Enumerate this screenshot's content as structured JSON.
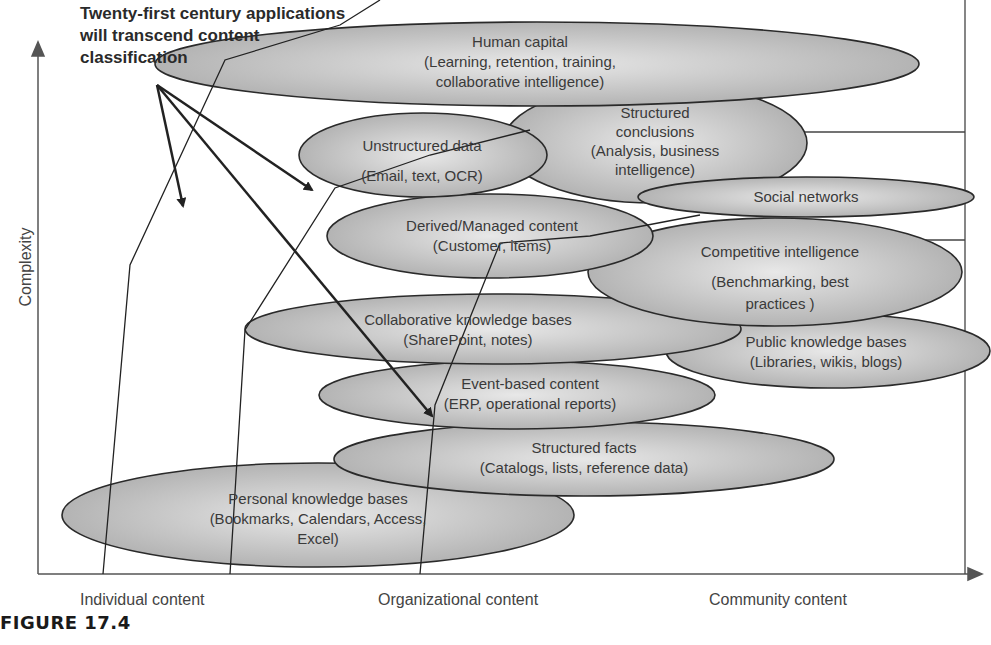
{
  "note": {
    "line1": "Twenty-first century  applications",
    "line2": "will transcend content",
    "line3": "classification"
  },
  "axes": {
    "y_label": "Complexity",
    "x_labels": [
      "Individual content",
      "Organizational  content",
      "Community content"
    ]
  },
  "caption": "FIGURE 17.4",
  "ellipses": [
    {
      "id": "human-capital",
      "lines": [
        "Human capital",
        "(Learning, retention, training,",
        "collaborative intelligence)"
      ]
    },
    {
      "id": "structured-conclusions",
      "lines": [
        "Structured",
        "conclusions",
        "(Analysis, business",
        "intelligence)"
      ]
    },
    {
      "id": "unstructured-data",
      "lines": [
        "Unstructured data",
        "(Email, text, OCR)"
      ]
    },
    {
      "id": "social-networks",
      "lines": [
        "Social networks"
      ]
    },
    {
      "id": "derived-managed",
      "lines": [
        "Derived/Managed content",
        "(Customer, items)"
      ]
    },
    {
      "id": "competitive-intelligence",
      "lines": [
        "Competitive intelligence",
        "(Benchmarking, best",
        "practices )"
      ]
    },
    {
      "id": "collaborative-kb",
      "lines": [
        "Collaborative knowledge bases",
        "(SharePoint, notes)"
      ]
    },
    {
      "id": "public-kb",
      "lines": [
        "Public knowledge bases",
        "(Libraries, wikis, blogs)"
      ]
    },
    {
      "id": "event-based",
      "lines": [
        "Event-based content",
        "(ERP, operational reports)"
      ]
    },
    {
      "id": "structured-facts",
      "lines": [
        "Structured facts",
        "(Catalogs, lists, reference data)"
      ]
    },
    {
      "id": "personal-kb",
      "lines": [
        "Personal knowledge bases",
        "(Bookmarks, Calendars, Access,",
        "Excel)"
      ]
    }
  ]
}
